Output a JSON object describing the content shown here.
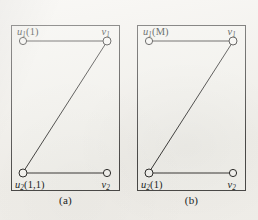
{
  "figure": {
    "background_color": "#f3f1ec",
    "ink_color": "#3a3937",
    "panels": [
      {
        "id": "a",
        "caption": "(a)",
        "nodes": [
          {
            "id": "u1",
            "label_base": "u",
            "label_sub": "1",
            "label_arg": "(1)",
            "x": 12,
            "y": 16,
            "position": "top-left"
          },
          {
            "id": "v1",
            "label_base": "v",
            "label_sub": "1",
            "label_arg": "",
            "x": 96,
            "y": 16,
            "position": "top-right"
          },
          {
            "id": "u2",
            "label_base": "u",
            "label_sub": "2",
            "label_arg": "(1,1)",
            "x": 12,
            "y": 148,
            "position": "bottom-left"
          },
          {
            "id": "v2",
            "label_base": "v",
            "label_sub": "2",
            "label_arg": "",
            "x": 96,
            "y": 148,
            "position": "bottom-right"
          }
        ],
        "edges": [
          {
            "from": "u1",
            "to": "v1",
            "kind": "horizontal-top"
          },
          {
            "from": "v1",
            "to": "u2",
            "kind": "diagonal"
          },
          {
            "from": "u2",
            "to": "v2",
            "kind": "horizontal-bottom"
          }
        ]
      },
      {
        "id": "b",
        "caption": "(b)",
        "nodes": [
          {
            "id": "u1",
            "label_base": "u",
            "label_sub": "1",
            "label_arg": "(M)",
            "x": 12,
            "y": 16,
            "position": "top-left"
          },
          {
            "id": "v1",
            "label_base": "v",
            "label_sub": "1",
            "label_arg": "",
            "x": 96,
            "y": 16,
            "position": "top-right"
          },
          {
            "id": "u2",
            "label_base": "u",
            "label_sub": "2",
            "label_arg": "(1)",
            "x": 12,
            "y": 148,
            "position": "bottom-left"
          },
          {
            "id": "v2",
            "label_base": "v",
            "label_sub": "2",
            "label_arg": "",
            "x": 96,
            "y": 148,
            "position": "bottom-right"
          }
        ],
        "edges": [
          {
            "from": "u1",
            "to": "v1",
            "kind": "horizontal-top"
          },
          {
            "from": "v1",
            "to": "u2",
            "kind": "diagonal"
          },
          {
            "from": "u2",
            "to": "v2",
            "kind": "horizontal-bottom"
          }
        ]
      }
    ]
  },
  "labels": {
    "panel_a": {
      "u1_base": "u",
      "u1_sub": "1",
      "u1_arg": "(1)",
      "v1_base": "v",
      "v1_sub": "1",
      "v1_arg": "",
      "u2_base": "u",
      "u2_sub": "2",
      "u2_arg": "(1,1)",
      "v2_base": "v",
      "v2_sub": "2",
      "v2_arg": "",
      "caption": "(a)"
    },
    "panel_b": {
      "u1_base": "u",
      "u1_sub": "1",
      "u1_arg": "(M)",
      "v1_base": "v",
      "v1_sub": "1",
      "v1_arg": "",
      "u2_base": "u",
      "u2_sub": "2",
      "u2_arg": "(1)",
      "v2_base": "v",
      "v2_sub": "2",
      "v2_arg": "",
      "caption": "(b)"
    }
  }
}
